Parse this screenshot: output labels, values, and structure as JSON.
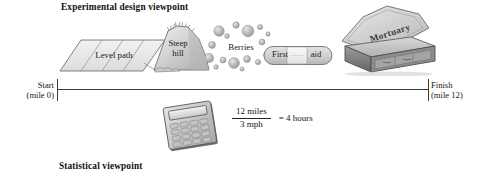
{
  "figure": {
    "headings": {
      "top": "Experimental design viewpoint",
      "bottom": "Statistical viewpoint"
    },
    "timeline": {
      "start_label_line1": "Start",
      "start_label_line2": "(mile 0)",
      "finish_label_line1": "Finish",
      "finish_label_line2": "(mile 12)"
    },
    "journey_items": [
      {
        "name": "level-path",
        "label": "Level path"
      },
      {
        "name": "steep-hill",
        "label_line1": "Steep",
        "label_line2": "hill"
      },
      {
        "name": "berries",
        "label": "Berries"
      },
      {
        "name": "first-aid",
        "label_word1": "First",
        "label_word2": "aid"
      },
      {
        "name": "mortuary",
        "label": "Mortuary"
      }
    ],
    "equation": {
      "numerator": "12 miles",
      "denominator": "3 mph",
      "result": "=  4 hours"
    },
    "colors": {
      "line": "#3a3a3a",
      "text": "#1a1a1a",
      "shape_fill_light": "#e9e9e9",
      "shape_fill_mid": "#cfcfcf",
      "shape_fill_dark": "#a6a6a6",
      "shape_stroke": "#6d6d6d",
      "background": "#ffffff"
    }
  }
}
